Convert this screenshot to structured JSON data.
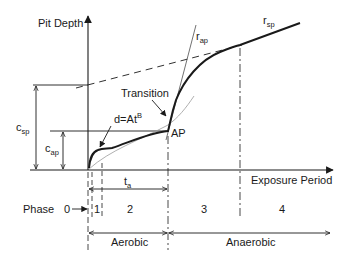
{
  "diagram": {
    "type": "pit depth vs exposure period phase diagram",
    "y_axis_label": "Pit Depth",
    "x_axis_label": "Exposure Period",
    "labels": {
      "transition": "Transition",
      "power_law": "d=At",
      "power_law_exponent": "B",
      "ap_point": "AP",
      "r_ap_main": "r",
      "r_ap_sub": "ap",
      "r_sp_main": "r",
      "r_sp_sub": "sp",
      "c_sp_main": "c",
      "c_sp_sub": "sp",
      "c_ap_main": "c",
      "c_ap_sub": "ap",
      "t_a_main": "t",
      "t_a_sub": "a"
    },
    "phase_row": {
      "label": "Phase",
      "phases": [
        "0",
        "1",
        "2",
        "3",
        "4"
      ]
    },
    "regimes": {
      "aerobic": "Aerobic",
      "anaerobic": "Anaerobic"
    },
    "colors": {
      "line": "#1a1a1a",
      "thin_line": "#444444",
      "light_line": "#9a9a9a",
      "background": "#ffffff"
    }
  }
}
